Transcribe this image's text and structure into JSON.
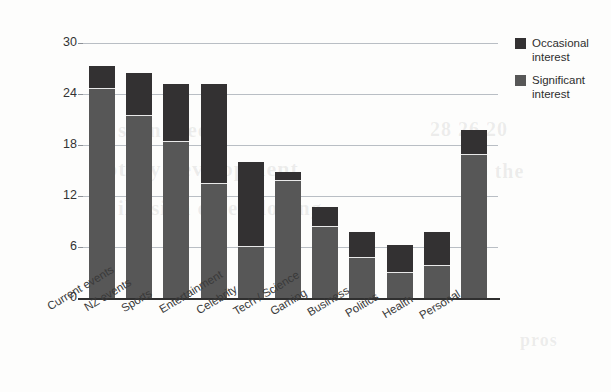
{
  "chart_data": {
    "type": "bar",
    "subtype": "stacked-vertical",
    "title": "",
    "xlabel": "",
    "ylabel": "",
    "ylim": [
      0,
      30
    ],
    "yticks": [
      0,
      6,
      12,
      18,
      24,
      30
    ],
    "grid": true,
    "legend_position": "right",
    "categories": [
      "Current events",
      "NZ events",
      "Sports",
      "Entertainment",
      "Celebrity",
      "Tech / Science",
      "Gaming",
      "Business",
      "Politics",
      "Health",
      "Personal"
    ],
    "series": [
      {
        "name": "Significant interest",
        "color": "#575757",
        "values": [
          24.7,
          21.5,
          18.5,
          13.5,
          6.1,
          13.9,
          8.5,
          4.8,
          3.1,
          3.9,
          17.0
        ]
      },
      {
        "name": "Occasional interest",
        "color": "#333132",
        "values": [
          2.6,
          5.0,
          6.7,
          11.7,
          9.9,
          0.9,
          2.2,
          3.0,
          3.1,
          3.9,
          2.8
        ]
      }
    ],
    "totals": [
      27.3,
      26.5,
      25.2,
      25.2,
      16.0,
      14.8,
      10.7,
      7.8,
      6.2,
      7.8,
      19.8
    ]
  },
  "legend": {
    "items": [
      {
        "label_line1": "Occasional",
        "label_line2": "interest",
        "color": "#333132",
        "swatch_name": "legend-swatch-occasional"
      },
      {
        "label_line1": "Significant",
        "label_line2": "interest",
        "color": "#575757",
        "swatch_name": "legend-swatch-significant"
      }
    ]
  },
  "axis": {
    "ytick_labels": [
      "30",
      "24",
      "18",
      "12",
      "6",
      "0"
    ]
  },
  "xtick_labels": [
    "Current events",
    "NZ events",
    "Sports",
    "Entertainment",
    "Celebrity",
    "Tech / Science",
    "Gaming",
    "Business",
    "Politics",
    "Health",
    "Personal"
  ],
  "scan_artifacts": {
    "ghost_lines": [
      {
        "text": "scan bleed",
        "x": 118,
        "y": 118,
        "size": 21
      },
      {
        "text": "rotary development",
        "x": 96,
        "y": 156,
        "size": 22
      },
      {
        "text": "illusion o developing",
        "x": 118,
        "y": 196,
        "size": 21
      },
      {
        "text": "28 26 20",
        "x": 430,
        "y": 118,
        "size": 20
      },
      {
        "text": "to the",
        "x": 470,
        "y": 160,
        "size": 20
      },
      {
        "text": "pros",
        "x": 520,
        "y": 330,
        "size": 18
      }
    ]
  }
}
